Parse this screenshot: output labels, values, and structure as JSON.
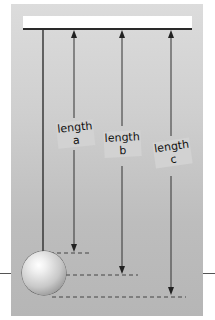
{
  "diagram": {
    "title": "",
    "labels": [
      {
        "id": "a",
        "line1": "length",
        "line2": "a",
        "endpoint": "top of ball"
      },
      {
        "id": "b",
        "line1": "length",
        "line2": "b",
        "endpoint": "center of ball"
      },
      {
        "id": "c",
        "line1": "length",
        "line2": "c",
        "endpoint": "bottom of ball"
      }
    ],
    "colors": {
      "panel_top": "#dcdcdc",
      "panel_bottom": "#b6b6b6",
      "line": "#2a2a2a",
      "bar": "#ffffff"
    }
  }
}
